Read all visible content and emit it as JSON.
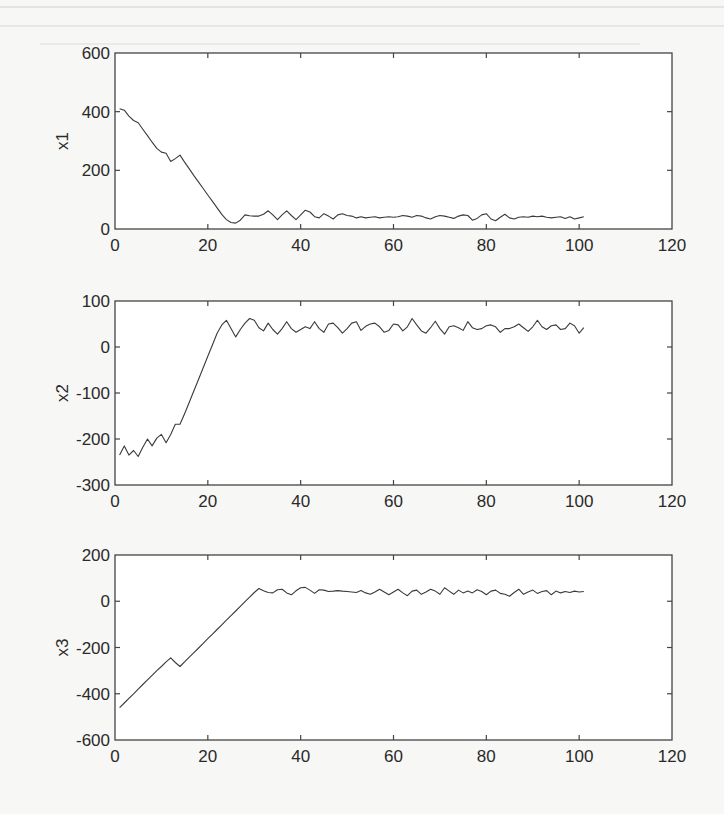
{
  "chart_data": [
    {
      "type": "line",
      "title": "",
      "xlabel": "",
      "ylabel": "x1",
      "xlim": [
        0,
        120
      ],
      "ylim": [
        0,
        600
      ],
      "xticks": [
        0,
        20,
        40,
        60,
        80,
        100,
        120
      ],
      "yticks": [
        0,
        200,
        400,
        600
      ],
      "grid": false,
      "legend": null,
      "series": [
        {
          "name": "x1",
          "x": [
            1,
            2,
            3,
            4,
            5,
            6,
            7,
            8,
            9,
            10,
            11,
            12,
            13,
            14,
            15,
            16,
            17,
            18,
            19,
            20,
            21,
            22,
            23,
            24,
            25,
            26,
            27,
            28,
            29,
            30,
            31,
            32,
            33,
            34,
            35,
            36,
            37,
            38,
            39,
            40,
            41,
            42,
            43,
            44,
            45,
            46,
            47,
            48,
            49,
            50,
            51,
            52,
            53,
            54,
            55,
            56,
            57,
            58,
            59,
            60,
            61,
            62,
            63,
            64,
            65,
            66,
            67,
            68,
            69,
            70,
            71,
            72,
            73,
            74,
            75,
            76,
            77,
            78,
            79,
            80,
            81,
            82,
            83,
            84,
            85,
            86,
            87,
            88,
            89,
            90,
            91,
            92,
            93,
            94,
            95,
            96,
            97,
            98,
            99,
            100,
            101
          ],
          "values": [
            410,
            405,
            385,
            370,
            362,
            340,
            318,
            296,
            275,
            262,
            258,
            230,
            240,
            252,
            228,
            205,
            182,
            160,
            138,
            116,
            94,
            72,
            50,
            32,
            22,
            20,
            30,
            48,
            45,
            44,
            44,
            50,
            62,
            48,
            32,
            48,
            62,
            46,
            32,
            48,
            64,
            58,
            42,
            38,
            52,
            44,
            34,
            48,
            52,
            46,
            44,
            38,
            42,
            38,
            40,
            42,
            38,
            40,
            42,
            40,
            42,
            46,
            44,
            40,
            46,
            44,
            38,
            34,
            42,
            46,
            44,
            40,
            36,
            44,
            48,
            46,
            30,
            36,
            48,
            52,
            34,
            28,
            40,
            50,
            38,
            34,
            40,
            42,
            40,
            44,
            42,
            44,
            40,
            38,
            40,
            42,
            36,
            42,
            34,
            38,
            42
          ]
        }
      ]
    },
    {
      "type": "line",
      "title": "",
      "xlabel": "",
      "ylabel": "x2",
      "xlim": [
        0,
        120
      ],
      "ylim": [
        -300,
        100
      ],
      "xticks": [
        0,
        20,
        40,
        60,
        80,
        100,
        120
      ],
      "yticks": [
        -300,
        -200,
        -100,
        0,
        100
      ],
      "grid": false,
      "legend": null,
      "series": [
        {
          "name": "x2",
          "x": [
            1,
            2,
            3,
            4,
            5,
            6,
            7,
            8,
            9,
            10,
            11,
            12,
            13,
            14,
            15,
            16,
            17,
            18,
            19,
            20,
            21,
            22,
            23,
            24,
            25,
            26,
            27,
            28,
            29,
            30,
            31,
            32,
            33,
            34,
            35,
            36,
            37,
            38,
            39,
            40,
            41,
            42,
            43,
            44,
            45,
            46,
            47,
            48,
            49,
            50,
            51,
            52,
            53,
            54,
            55,
            56,
            57,
            58,
            59,
            60,
            61,
            62,
            63,
            64,
            65,
            66,
            67,
            68,
            69,
            70,
            71,
            72,
            73,
            74,
            75,
            76,
            77,
            78,
            79,
            80,
            81,
            82,
            83,
            84,
            85,
            86,
            87,
            88,
            89,
            90,
            91,
            92,
            93,
            94,
            95,
            96,
            97,
            98,
            99,
            100,
            101
          ],
          "values": [
            -235,
            -215,
            -235,
            -225,
            -238,
            -218,
            -200,
            -215,
            -198,
            -190,
            -208,
            -190,
            -168,
            -168,
            -145,
            -120,
            -95,
            -70,
            -45,
            -20,
            5,
            30,
            48,
            58,
            40,
            22,
            38,
            52,
            62,
            58,
            42,
            35,
            52,
            38,
            28,
            40,
            55,
            40,
            32,
            38,
            44,
            40,
            55,
            40,
            32,
            50,
            52,
            42,
            30,
            40,
            52,
            55,
            36,
            45,
            50,
            52,
            44,
            32,
            36,
            50,
            48,
            35,
            44,
            62,
            48,
            35,
            30,
            42,
            56,
            40,
            28,
            44,
            46,
            42,
            36,
            55,
            42,
            38,
            40,
            46,
            48,
            44,
            32,
            40,
            40,
            44,
            50,
            42,
            34,
            44,
            58,
            44,
            38,
            46,
            48,
            38,
            40,
            52,
            46,
            30,
            42
          ]
        }
      ]
    },
    {
      "type": "line",
      "title": "",
      "xlabel": "",
      "ylabel": "x3",
      "xlim": [
        0,
        120
      ],
      "ylim": [
        -600,
        200
      ],
      "xticks": [
        0,
        20,
        40,
        60,
        80,
        100,
        120
      ],
      "yticks": [
        -600,
        -400,
        -200,
        0,
        200
      ],
      "grid": false,
      "legend": null,
      "series": [
        {
          "name": "x3",
          "x": [
            1,
            2,
            3,
            4,
            5,
            6,
            7,
            8,
            9,
            10,
            11,
            12,
            13,
            14,
            15,
            16,
            17,
            18,
            19,
            20,
            21,
            22,
            23,
            24,
            25,
            26,
            27,
            28,
            29,
            30,
            31,
            32,
            33,
            34,
            35,
            36,
            37,
            38,
            39,
            40,
            41,
            42,
            43,
            44,
            45,
            46,
            47,
            48,
            49,
            50,
            51,
            52,
            53,
            54,
            55,
            56,
            57,
            58,
            59,
            60,
            61,
            62,
            63,
            64,
            65,
            66,
            67,
            68,
            69,
            70,
            71,
            72,
            73,
            74,
            75,
            76,
            77,
            78,
            79,
            80,
            81,
            82,
            83,
            84,
            85,
            86,
            87,
            88,
            89,
            90,
            91,
            92,
            93,
            94,
            95,
            96,
            97,
            98,
            99,
            100,
            101
          ],
          "values": [
            -460,
            -440,
            -420,
            -400,
            -380,
            -360,
            -340,
            -320,
            -300,
            -282,
            -262,
            -245,
            -265,
            -282,
            -262,
            -242,
            -222,
            -202,
            -182,
            -162,
            -142,
            -122,
            -102,
            -82,
            -62,
            -42,
            -22,
            -2,
            18,
            38,
            55,
            45,
            38,
            36,
            50,
            52,
            36,
            28,
            45,
            58,
            60,
            48,
            34,
            50,
            48,
            42,
            44,
            46,
            44,
            42,
            40,
            38,
            46,
            36,
            30,
            40,
            52,
            40,
            28,
            40,
            52,
            36,
            24,
            44,
            48,
            30,
            40,
            52,
            44,
            30,
            58,
            44,
            30,
            48,
            36,
            44,
            36,
            50,
            42,
            28,
            44,
            48,
            34,
            30,
            22,
            38,
            52,
            30,
            40,
            48,
            34,
            42,
            46,
            28,
            44,
            36,
            42,
            38,
            44,
            40,
            42
          ]
        }
      ]
    }
  ],
  "figure": {
    "panels": [
      {
        "ylabel": "x1",
        "ytick_labels": [
          "0",
          "200",
          "400",
          "600"
        ]
      },
      {
        "ylabel": "x2",
        "ytick_labels": [
          "-300",
          "-200",
          "-100",
          "0",
          "100"
        ]
      },
      {
        "ylabel": "x3",
        "ytick_labels": [
          "-600",
          "-400",
          "-200",
          "0",
          "200"
        ]
      }
    ],
    "xtick_labels": [
      "0",
      "20",
      "40",
      "60",
      "80",
      "100",
      "120"
    ]
  }
}
